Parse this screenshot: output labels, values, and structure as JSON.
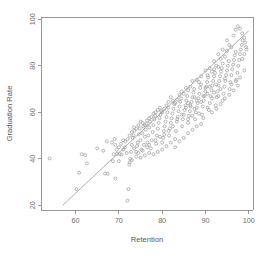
{
  "figure": {
    "width": 272,
    "height": 258,
    "background": "#ffffff",
    "marker_color": "#9a9a9a",
    "line_color": "#9a9a9a",
    "axis_color": "#808080",
    "text_color": "#6b6b6b"
  },
  "plot_area": {
    "left": 41,
    "right": 253,
    "top": 17,
    "bottom": 210
  },
  "chart_data": {
    "type": "scatter",
    "title": "",
    "xlabel": "Retention",
    "ylabel": "Graduation Rate",
    "xlim": [
      52,
      101
    ],
    "ylim": [
      18,
      101
    ],
    "xticks": [
      60,
      70,
      80,
      90,
      100
    ],
    "xtick_labels": [
      "60",
      "70",
      "80",
      "90",
      "100"
    ],
    "yticks": [
      20,
      40,
      60,
      80,
      100
    ],
    "ytick_labels": [
      "20",
      "40",
      "60",
      "80",
      "100"
    ],
    "grid": false,
    "legend": null,
    "marker": "open-circle",
    "marker_size": 3,
    "trend_line": {
      "type": "linear-fit",
      "x_start": 57.0,
      "y_start": 20.0,
      "x_end": 100.0,
      "y_end": 95.0,
      "slope": 1.744,
      "intercept": -79.4
    },
    "n_points": 281,
    "points": [
      [
        54.0,
        40.2
      ],
      [
        60.8,
        34.0
      ],
      [
        60.2,
        27.0
      ],
      [
        61.4,
        42.0
      ],
      [
        62.2,
        41.6
      ],
      [
        62.6,
        38.0
      ],
      [
        65.0,
        44.5
      ],
      [
        66.4,
        43.5
      ],
      [
        66.8,
        33.7
      ],
      [
        67.4,
        33.6
      ],
      [
        69.2,
        31.5
      ],
      [
        68.6,
        39.0
      ],
      [
        68.8,
        42.0
      ],
      [
        69.6,
        42.2
      ],
      [
        69.2,
        46.0
      ],
      [
        68.4,
        47.0
      ],
      [
        69.0,
        48.5
      ],
      [
        67.2,
        47.5
      ],
      [
        70.2,
        42.0
      ],
      [
        70.6,
        41.8
      ],
      [
        71.0,
        44.0
      ],
      [
        71.4,
        45.0
      ],
      [
        71.8,
        42.5
      ],
      [
        72.0,
        22.0
      ],
      [
        72.2,
        27.0
      ],
      [
        72.4,
        37.5
      ],
      [
        72.6,
        40.0
      ],
      [
        72.8,
        43.0
      ],
      [
        73.0,
        46.0
      ],
      [
        73.2,
        49.0
      ],
      [
        73.4,
        50.0
      ],
      [
        73.6,
        52.0
      ],
      [
        74.0,
        43.0
      ],
      [
        74.2,
        45.5
      ],
      [
        74.4,
        47.0
      ],
      [
        74.6,
        50.5
      ],
      [
        74.8,
        53.0
      ],
      [
        75.0,
        48.0
      ],
      [
        75.2,
        44.0
      ],
      [
        75.4,
        51.0
      ],
      [
        75.6,
        54.0
      ],
      [
        75.8,
        46.0
      ],
      [
        76.0,
        49.5
      ],
      [
        76.2,
        52.5
      ],
      [
        76.4,
        55.0
      ],
      [
        76.6,
        47.0
      ],
      [
        76.8,
        50.0
      ],
      [
        77.0,
        53.5
      ],
      [
        77.2,
        56.0
      ],
      [
        77.4,
        44.5
      ],
      [
        77.6,
        48.0
      ],
      [
        77.8,
        51.5
      ],
      [
        78.0,
        54.5
      ],
      [
        78.2,
        57.0
      ],
      [
        78.4,
        58.5
      ],
      [
        78.6,
        46.5
      ],
      [
        78.8,
        50.0
      ],
      [
        79.0,
        53.0
      ],
      [
        79.2,
        55.5
      ],
      [
        79.4,
        57.5
      ],
      [
        79.6,
        59.0
      ],
      [
        79.8,
        60.5
      ],
      [
        80.0,
        47.0
      ],
      [
        80.2,
        49.0
      ],
      [
        80.4,
        52.0
      ],
      [
        80.6,
        54.0
      ],
      [
        80.8,
        56.0
      ],
      [
        81.0,
        58.0
      ],
      [
        81.2,
        60.0
      ],
      [
        81.4,
        62.0
      ],
      [
        81.6,
        50.0
      ],
      [
        81.8,
        53.0
      ],
      [
        82.0,
        55.5
      ],
      [
        82.2,
        57.5
      ],
      [
        82.4,
        59.5
      ],
      [
        82.6,
        61.5
      ],
      [
        82.8,
        63.5
      ],
      [
        83.0,
        48.5
      ],
      [
        83.2,
        52.0
      ],
      [
        83.4,
        56.0
      ],
      [
        83.6,
        58.0
      ],
      [
        83.8,
        60.5
      ],
      [
        84.0,
        62.5
      ],
      [
        84.2,
        64.5
      ],
      [
        84.4,
        66.0
      ],
      [
        84.6,
        54.0
      ],
      [
        84.8,
        57.0
      ],
      [
        85.0,
        59.0
      ],
      [
        85.2,
        61.0
      ],
      [
        85.4,
        63.0
      ],
      [
        85.6,
        65.0
      ],
      [
        85.8,
        67.0
      ],
      [
        86.0,
        55.5
      ],
      [
        86.2,
        58.5
      ],
      [
        86.4,
        60.5
      ],
      [
        86.6,
        62.5
      ],
      [
        86.8,
        64.5
      ],
      [
        87.0,
        66.5
      ],
      [
        87.2,
        68.5
      ],
      [
        87.4,
        70.0
      ],
      [
        87.6,
        57.0
      ],
      [
        87.8,
        60.0
      ],
      [
        88.0,
        62.0
      ],
      [
        88.2,
        64.0
      ],
      [
        88.4,
        66.0
      ],
      [
        88.6,
        68.0
      ],
      [
        88.8,
        70.5
      ],
      [
        89.0,
        72.0
      ],
      [
        89.2,
        59.0
      ],
      [
        89.4,
        62.5
      ],
      [
        89.6,
        65.0
      ],
      [
        89.8,
        67.0
      ],
      [
        90.0,
        69.0
      ],
      [
        90.2,
        71.0
      ],
      [
        90.4,
        73.0
      ],
      [
        90.6,
        75.0
      ],
      [
        90.8,
        61.0
      ],
      [
        91.0,
        64.0
      ],
      [
        91.2,
        67.0
      ],
      [
        91.4,
        69.5
      ],
      [
        91.6,
        71.5
      ],
      [
        91.8,
        73.5
      ],
      [
        92.0,
        75.5
      ],
      [
        92.2,
        77.0
      ],
      [
        92.4,
        63.0
      ],
      [
        92.6,
        66.5
      ],
      [
        92.8,
        69.0
      ],
      [
        93.0,
        71.5
      ],
      [
        93.2,
        73.5
      ],
      [
        93.4,
        75.5
      ],
      [
        93.6,
        77.5
      ],
      [
        93.8,
        79.0
      ],
      [
        94.0,
        65.0
      ],
      [
        94.2,
        68.0
      ],
      [
        94.4,
        71.0
      ],
      [
        94.6,
        73.5
      ],
      [
        94.8,
        76.0
      ],
      [
        95.0,
        78.0
      ],
      [
        95.2,
        80.0
      ],
      [
        95.4,
        82.0
      ],
      [
        95.6,
        70.0
      ],
      [
        95.8,
        73.0
      ],
      [
        96.0,
        76.0
      ],
      [
        96.2,
        78.5
      ],
      [
        96.4,
        80.5
      ],
      [
        96.6,
        82.5
      ],
      [
        96.8,
        84.5
      ],
      [
        97.0,
        86.0
      ],
      [
        97.2,
        74.0
      ],
      [
        97.4,
        77.0
      ],
      [
        97.6,
        80.0
      ],
      [
        97.8,
        82.5
      ],
      [
        98.0,
        85.0
      ],
      [
        98.2,
        87.0
      ],
      [
        98.4,
        89.0
      ],
      [
        98.6,
        91.0
      ],
      [
        96.5,
        93.0
      ],
      [
        97.0,
        95.5
      ],
      [
        97.5,
        97.0
      ],
      [
        98.0,
        96.0
      ],
      [
        98.5,
        94.0
      ],
      [
        99.0,
        92.0
      ],
      [
        99.2,
        90.0
      ],
      [
        99.4,
        88.0
      ],
      [
        95.0,
        91.0
      ],
      [
        95.5,
        89.0
      ],
      [
        94.0,
        87.0
      ],
      [
        94.5,
        84.0
      ],
      [
        93.0,
        85.0
      ],
      [
        93.5,
        83.0
      ],
      [
        92.0,
        82.0
      ],
      [
        92.5,
        80.0
      ],
      [
        91.0,
        79.0
      ],
      [
        91.5,
        77.5
      ],
      [
        90.0,
        78.0
      ],
      [
        90.5,
        76.0
      ],
      [
        89.0,
        75.5
      ],
      [
        88.5,
        73.0
      ],
      [
        88.0,
        74.0
      ],
      [
        87.0,
        73.5
      ],
      [
        86.5,
        71.0
      ],
      [
        86.0,
        69.5
      ],
      [
        85.5,
        70.5
      ],
      [
        85.0,
        68.0
      ],
      [
        84.5,
        69.0
      ],
      [
        84.0,
        67.5
      ],
      [
        83.5,
        65.5
      ],
      [
        83.0,
        64.0
      ],
      [
        82.5,
        65.0
      ],
      [
        82.0,
        66.5
      ],
      [
        81.5,
        64.5
      ],
      [
        81.0,
        63.0
      ],
      [
        80.5,
        61.5
      ],
      [
        80.0,
        60.0
      ],
      [
        79.5,
        62.0
      ],
      [
        79.0,
        61.0
      ],
      [
        78.5,
        60.0
      ],
      [
        78.0,
        59.5
      ],
      [
        77.5,
        58.0
      ],
      [
        77.0,
        57.5
      ],
      [
        76.5,
        56.5
      ],
      [
        76.0,
        54.5
      ],
      [
        75.5,
        55.5
      ],
      [
        75.0,
        56.0
      ],
      [
        74.5,
        54.5
      ],
      [
        74.0,
        53.0
      ],
      [
        73.5,
        53.5
      ],
      [
        73.0,
        51.5
      ],
      [
        72.5,
        50.0
      ],
      [
        72.0,
        48.5
      ],
      [
        71.5,
        47.5
      ],
      [
        71.0,
        48.0
      ],
      [
        70.5,
        46.5
      ],
      [
        70.0,
        45.0
      ],
      [
        69.5,
        44.0
      ],
      [
        86.0,
        57.0
      ],
      [
        87.0,
        58.5
      ],
      [
        88.5,
        59.5
      ],
      [
        89.5,
        57.5
      ],
      [
        90.5,
        62.0
      ],
      [
        91.5,
        60.0
      ],
      [
        92.5,
        61.5
      ],
      [
        93.5,
        63.5
      ],
      [
        94.5,
        66.0
      ],
      [
        95.5,
        67.5
      ],
      [
        96.5,
        69.5
      ],
      [
        97.5,
        71.5
      ],
      [
        83.0,
        45.0
      ],
      [
        84.0,
        47.5
      ],
      [
        85.0,
        49.0
      ],
      [
        86.0,
        51.0
      ],
      [
        87.0,
        52.5
      ],
      [
        88.0,
        54.0
      ],
      [
        89.0,
        55.0
      ],
      [
        82.0,
        47.0
      ],
      [
        81.0,
        45.5
      ],
      [
        80.0,
        44.0
      ],
      [
        79.0,
        43.0
      ],
      [
        78.0,
        42.0
      ],
      [
        77.0,
        42.5
      ],
      [
        76.0,
        41.5
      ],
      [
        75.0,
        40.5
      ],
      [
        74.0,
        41.0
      ],
      [
        73.0,
        39.5
      ],
      [
        72.5,
        38.5
      ],
      [
        99.0,
        85.0
      ],
      [
        98.5,
        83.0
      ],
      [
        99.5,
        87.0
      ],
      [
        96.0,
        88.0
      ],
      [
        95.0,
        86.5
      ],
      [
        94.0,
        81.0
      ],
      [
        93.0,
        79.5
      ],
      [
        92.0,
        78.5
      ],
      [
        96.0,
        72.0
      ],
      [
        97.0,
        73.5
      ],
      [
        98.0,
        75.0
      ],
      [
        99.0,
        78.0
      ],
      [
        89.5,
        67.0
      ],
      [
        90.5,
        68.0
      ],
      [
        91.5,
        66.0
      ],
      [
        92.5,
        72.0
      ],
      [
        93.5,
        70.0
      ],
      [
        94.5,
        74.5
      ],
      [
        85.5,
        62.0
      ],
      [
        86.5,
        63.0
      ],
      [
        87.5,
        61.5
      ],
      [
        84.5,
        59.0
      ],
      [
        83.5,
        57.0
      ],
      [
        82.5,
        54.0
      ],
      [
        81.5,
        52.0
      ],
      [
        80.5,
        50.5
      ],
      [
        79.5,
        49.5
      ],
      [
        78.5,
        48.0
      ],
      [
        88.0,
        65.0
      ],
      [
        87.5,
        66.5
      ],
      [
        86.0,
        64.0
      ],
      [
        91.0,
        71.0
      ],
      [
        90.0,
        70.5
      ],
      [
        89.0,
        64.5
      ],
      [
        92.0,
        68.5
      ],
      [
        93.0,
        67.0
      ],
      [
        77.0,
        46.0
      ],
      [
        76.5,
        45.0
      ],
      [
        75.5,
        43.5
      ],
      [
        74.5,
        42.5
      ],
      [
        73.5,
        44.5
      ],
      [
        70.0,
        39.0
      ]
    ]
  }
}
